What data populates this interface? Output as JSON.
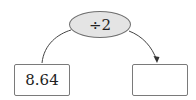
{
  "diagram": {
    "operation": {
      "label": "÷2",
      "fill": "#e4e4e4",
      "stroke": "#6f6f6f"
    },
    "input_box": {
      "value": "8.64"
    },
    "output_box": {
      "value": ""
    },
    "arrow": {
      "from": "input_box",
      "to": "output_box",
      "via": "operation"
    }
  }
}
